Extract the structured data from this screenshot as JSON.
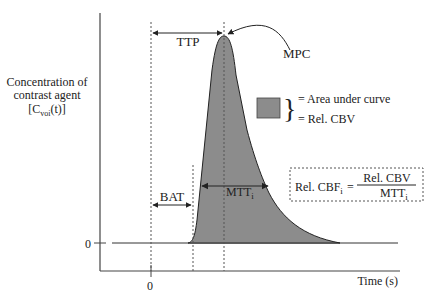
{
  "diagram": {
    "type": "bolus-tracking perfusion curve",
    "y_axis_label": [
      "Concentration of",
      "contrast agent"
    ],
    "y_axis_label_symbol": {
      "base": "[C",
      "sub": "voi",
      "tail": "(t)]"
    },
    "y_zero_label": "0",
    "x_zero_label": "0",
    "x_axis_label": "Time (s)",
    "annotations": {
      "ttp": "TTP",
      "mpc": "MPC",
      "bat": "BAT",
      "mtt": {
        "base": "MTT",
        "sub": "i"
      }
    },
    "legend": {
      "line1": "= Area under curve",
      "line2": "= Rel. CBV"
    },
    "formula": {
      "lhs_base": "Rel. CBF",
      "lhs_sub": "i",
      "equals": "=",
      "numerator": "Rel. CBV",
      "denominator_base": "MTT",
      "denominator_sub": "i"
    },
    "colors": {
      "fill": "#8c8c8c",
      "line": "#222222",
      "dashed": "#555555"
    }
  }
}
